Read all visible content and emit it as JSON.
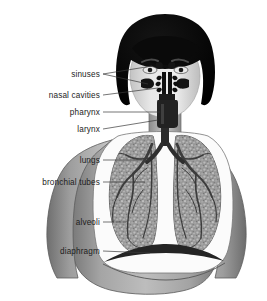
{
  "figure": {
    "background_color": "#ffffff",
    "style": "grayscale halftone illustration"
  },
  "labels": [
    {
      "id": "sinuses",
      "text": "sinuses",
      "text_x": 100,
      "text_y": 77,
      "leader_kind": "forked"
    },
    {
      "id": "nasal-cavities",
      "text": "nasal cavities",
      "text_x": 100,
      "text_y": 98,
      "leader_kind": "straight"
    },
    {
      "id": "pharynx",
      "text": "pharynx",
      "text_x": 100,
      "text_y": 115,
      "leader_kind": "straight"
    },
    {
      "id": "larynx",
      "text": "larynx",
      "text_x": 100,
      "text_y": 132,
      "leader_kind": "straight"
    },
    {
      "id": "lungs",
      "text": "lungs",
      "text_x": 100,
      "text_y": 163,
      "leader_kind": "straight"
    },
    {
      "id": "bronchial-tubes",
      "text": "bronchial tubes",
      "text_x": 100,
      "text_y": 185,
      "leader_kind": "straight"
    },
    {
      "id": "alveoli",
      "text": "alveoli",
      "text_x": 100,
      "text_y": 225,
      "leader_kind": "straight"
    },
    {
      "id": "diaphragm",
      "text": "diaphragm",
      "text_x": 100,
      "text_y": 254,
      "leader_kind": "straight"
    }
  ],
  "colors": {
    "hair": "#0a0a0a",
    "skin": "#cfcfcf",
    "skin_light": "#ebebeb",
    "body_gray": "#9a9a9a",
    "body_dark": "#6e6e6e",
    "cavity_white": "#fbfbfb",
    "lung_tissue": "#8e8e8e",
    "bronchi_dark": "#3c3c3c",
    "airway_dark": "#2a2a2a",
    "diaphragm": "#242424",
    "label_text": "#1d1d1d",
    "leader_line": "#3a3a3a"
  }
}
